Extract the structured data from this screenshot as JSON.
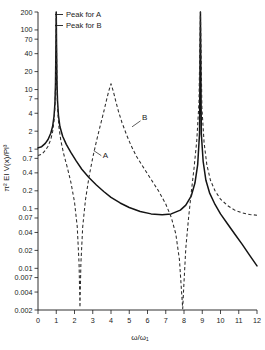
{
  "chart_data": {
    "type": "line",
    "title": "",
    "xlabel": "ω/ω₁",
    "ylabel": "π² EI V(x)/Pl³",
    "xlim": [
      0,
      12
    ],
    "ylim": [
      0.002,
      200
    ],
    "yscale": "log",
    "xscale": "linear",
    "grid": false,
    "legend_position": "top-left",
    "xticks": [
      0,
      1,
      2,
      3,
      4,
      5,
      6,
      7,
      8,
      9,
      10,
      11,
      12
    ],
    "xtick_labels": [
      "0",
      "1",
      "2",
      "3",
      "4",
      "5",
      "6",
      "7",
      "8",
      "9",
      "10",
      "11",
      "12"
    ],
    "yticks": [
      0.002,
      0.004,
      0.007,
      0.01,
      0.02,
      0.04,
      0.07,
      0.1,
      0.2,
      0.4,
      0.7,
      1,
      2,
      4,
      7,
      10,
      20,
      40,
      70,
      100,
      200
    ],
    "ytick_labels": [
      "0.002",
      "0.004",
      "0.007",
      "0.01",
      "0.02",
      "0.04",
      "0.07",
      "0.1",
      "0.2",
      "0.4",
      "0.7",
      "1",
      "2",
      "4",
      "7",
      "10",
      "20",
      "40",
      "70",
      "100",
      "200"
    ],
    "annotations": [
      {
        "text": "A",
        "x": 3.55,
        "y": 0.72
      },
      {
        "text": "B",
        "x": 5.7,
        "y": 3.1
      }
    ],
    "legend": [
      {
        "label": "Peak for A",
        "style": "solid-marker"
      },
      {
        "label": "Peak for B",
        "style": "solid-marker"
      }
    ],
    "series": [
      {
        "name": "A",
        "style": "solid",
        "color": "#141414",
        "resonances": [
          1.0,
          8.9
        ],
        "antiresonances": [],
        "points": [
          [
            0.0,
            1.05
          ],
          [
            0.2,
            1.1
          ],
          [
            0.4,
            1.25
          ],
          [
            0.55,
            1.45
          ],
          [
            0.7,
            1.85
          ],
          [
            0.8,
            2.4
          ],
          [
            0.88,
            3.6
          ],
          [
            0.93,
            6.0
          ],
          [
            0.96,
            13.0
          ],
          [
            0.985,
            60.0
          ],
          [
            1.0,
            200.0
          ],
          [
            1.015,
            60.0
          ],
          [
            1.04,
            13.0
          ],
          [
            1.07,
            6.5
          ],
          [
            1.12,
            3.7
          ],
          [
            1.2,
            2.4
          ],
          [
            1.35,
            1.65
          ],
          [
            1.55,
            1.2
          ],
          [
            1.8,
            0.88
          ],
          [
            2.1,
            0.63
          ],
          [
            2.4,
            0.46
          ],
          [
            2.8,
            0.33
          ],
          [
            3.2,
            0.25
          ],
          [
            3.6,
            0.195
          ],
          [
            4.0,
            0.155
          ],
          [
            4.5,
            0.125
          ],
          [
            5.0,
            0.105
          ],
          [
            5.6,
            0.09
          ],
          [
            6.2,
            0.082
          ],
          [
            6.8,
            0.079
          ],
          [
            7.3,
            0.082
          ],
          [
            7.8,
            0.095
          ],
          [
            8.1,
            0.115
          ],
          [
            8.4,
            0.165
          ],
          [
            8.6,
            0.27
          ],
          [
            8.75,
            0.55
          ],
          [
            8.85,
            1.8
          ],
          [
            8.9,
            200.0
          ],
          [
            8.95,
            1.8
          ],
          [
            9.05,
            0.62
          ],
          [
            9.2,
            0.3
          ],
          [
            9.4,
            0.185
          ],
          [
            9.7,
            0.118
          ],
          [
            10.0,
            0.082
          ],
          [
            10.4,
            0.055
          ],
          [
            10.8,
            0.037
          ],
          [
            11.2,
            0.025
          ],
          [
            11.6,
            0.0165
          ],
          [
            12.0,
            0.011
          ]
        ]
      },
      {
        "name": "B",
        "style": "dashed",
        "color": "#2b2b2b",
        "resonances": [
          1.0,
          4.0,
          8.9
        ],
        "antiresonances": [
          2.3,
          7.9
        ],
        "points": [
          [
            0.0,
            0.78
          ],
          [
            0.2,
            0.82
          ],
          [
            0.4,
            0.95
          ],
          [
            0.55,
            1.12
          ],
          [
            0.7,
            1.45
          ],
          [
            0.8,
            1.95
          ],
          [
            0.88,
            3.0
          ],
          [
            0.93,
            5.2
          ],
          [
            0.96,
            11.0
          ],
          [
            0.985,
            55.0
          ],
          [
            1.0,
            200.0
          ],
          [
            1.015,
            50.0
          ],
          [
            1.04,
            10.0
          ],
          [
            1.08,
            4.3
          ],
          [
            1.15,
            2.3
          ],
          [
            1.25,
            1.4
          ],
          [
            1.4,
            0.85
          ],
          [
            1.6,
            0.5
          ],
          [
            1.8,
            0.28
          ],
          [
            2.0,
            0.13
          ],
          [
            2.15,
            0.05
          ],
          [
            2.25,
            0.012
          ],
          [
            2.3,
            0.0022
          ],
          [
            2.35,
            0.012
          ],
          [
            2.45,
            0.05
          ],
          [
            2.6,
            0.14
          ],
          [
            2.8,
            0.35
          ],
          [
            3.0,
            0.72
          ],
          [
            3.2,
            1.35
          ],
          [
            3.4,
            2.4
          ],
          [
            3.6,
            4.2
          ],
          [
            3.75,
            6.6
          ],
          [
            3.88,
            9.5
          ],
          [
            4.0,
            12.5
          ],
          [
            4.12,
            9.5
          ],
          [
            4.25,
            6.6
          ],
          [
            4.4,
            4.4
          ],
          [
            4.6,
            2.8
          ],
          [
            4.85,
            1.75
          ],
          [
            5.1,
            1.15
          ],
          [
            5.4,
            0.75
          ],
          [
            5.8,
            0.48
          ],
          [
            6.2,
            0.31
          ],
          [
            6.6,
            0.2
          ],
          [
            7.0,
            0.12
          ],
          [
            7.3,
            0.072
          ],
          [
            7.55,
            0.038
          ],
          [
            7.75,
            0.014
          ],
          [
            7.88,
            0.0035
          ],
          [
            7.93,
            0.0021
          ],
          [
            7.98,
            0.0045
          ],
          [
            8.1,
            0.022
          ],
          [
            8.25,
            0.07
          ],
          [
            8.4,
            0.19
          ],
          [
            8.55,
            0.48
          ],
          [
            8.7,
            1.4
          ],
          [
            8.82,
            6.0
          ],
          [
            8.9,
            200.0
          ],
          [
            8.98,
            5.0
          ],
          [
            9.1,
            1.3
          ],
          [
            9.25,
            0.55
          ],
          [
            9.45,
            0.3
          ],
          [
            9.7,
            0.2
          ],
          [
            10.0,
            0.145
          ],
          [
            10.4,
            0.112
          ],
          [
            10.8,
            0.094
          ],
          [
            11.2,
            0.085
          ],
          [
            11.6,
            0.08
          ],
          [
            12.0,
            0.078
          ]
        ]
      }
    ]
  },
  "legend": {
    "peak_a_label": "Peak for A",
    "peak_b_label": "Peak for B"
  },
  "labels": {
    "curve_a": "A",
    "curve_b": "B",
    "x_axis_title": "ω/ω₁",
    "y_axis_title": "π² EI V(x)/Pl³"
  },
  "colors": {
    "curve_a": "#141414",
    "curve_b": "#2b2b2b",
    "axis": "#1a1a1a",
    "background": "#ffffff"
  }
}
